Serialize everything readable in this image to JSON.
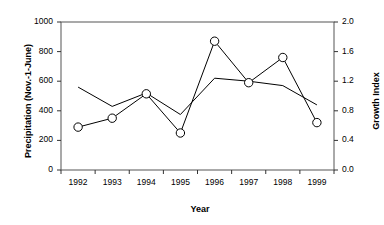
{
  "chart_data": {
    "type": "line",
    "title": "",
    "xlabel": "Year",
    "ylabel": "Precipitation (Nov.-1-June)",
    "ylabel_right": "Growth Index",
    "categories": [
      "1992",
      "1993",
      "1994",
      "1995",
      "1996",
      "1997",
      "1998",
      "1999"
    ],
    "x": [
      1992,
      1993,
      1994,
      1995,
      1996,
      1997,
      1998,
      1999
    ],
    "ylim": [
      0,
      1000
    ],
    "yticks": [
      "0",
      "200",
      "400",
      "600",
      "800",
      "1000"
    ],
    "ytick_values": [
      0,
      200,
      400,
      600,
      800,
      1000
    ],
    "ylim_right": [
      0,
      2.0
    ],
    "yticks_right": [
      "0.0",
      "0.4",
      "0.8",
      "1.2",
      "1.6",
      "2.0"
    ],
    "ytick_right_values": [
      0.0,
      0.4,
      0.8,
      1.2,
      1.6,
      2.0
    ],
    "grid": false,
    "legend": "none",
    "series": [
      {
        "name": "Precipitation (Nov.-1-June)",
        "axis": "left",
        "marker": "none",
        "values": [
          560,
          430,
          520,
          375,
          620,
          600,
          570,
          440
        ]
      },
      {
        "name": "Growth Index",
        "axis": "right",
        "marker": "open-circle",
        "values": [
          0.58,
          0.7,
          1.03,
          0.5,
          1.74,
          1.18,
          1.52,
          0.64
        ]
      }
    ]
  },
  "axes": {
    "x_title": "Year",
    "y_left_title": "Precipitation (Nov.-1-June)",
    "y_right_title": "Growth Index"
  }
}
